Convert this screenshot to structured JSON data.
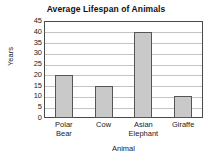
{
  "chart_data": {
    "type": "bar",
    "title": "Average Lifespan of Animals",
    "xlabel": "Animal",
    "ylabel": "Years",
    "categories": [
      "Polar Bear",
      "Cow",
      "Asian Elephant",
      "Giraffe"
    ],
    "values": [
      20,
      15,
      40,
      10
    ],
    "ylim": [
      0,
      45
    ],
    "ytick_step": 5,
    "yticks": [
      45,
      40,
      35,
      30,
      25,
      20,
      15,
      10,
      5,
      0
    ],
    "grid": "horizontal",
    "legend": "none",
    "bar_color": "#c9c9c9",
    "bar_border_color": "#555555",
    "gridline_color": "#c4c4c4",
    "axis_color": "#4a4a4a",
    "background": "#ffffff"
  }
}
